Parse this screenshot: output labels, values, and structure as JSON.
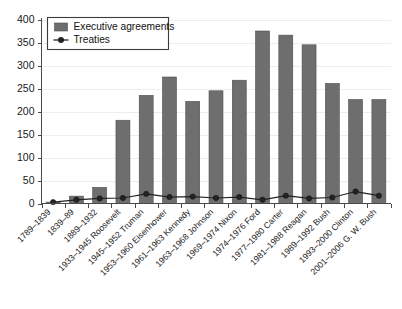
{
  "chart_data": {
    "type": "bar",
    "title": "",
    "subtitle": "",
    "xlabel": "",
    "ylabel": "",
    "ylim": [
      0,
      400
    ],
    "yticks": [
      0,
      50,
      100,
      150,
      200,
      250,
      300,
      350,
      400
    ],
    "ytick_labels": [
      "0",
      "50",
      "100",
      "150",
      "200",
      "250",
      "300",
      "350",
      "400"
    ],
    "grid": true,
    "grid_axis": "y",
    "legend_position": "upper-left",
    "categories": [
      "1789–1839",
      "1839–89",
      "1889–1932",
      "1933–1945 Roosevelt",
      "1945–1952 Truman",
      "1953–1960 Eisenhower",
      "1961–1963 Kennedy",
      "1963–1968 Johnson",
      "1969–1974 Nixon",
      "1974–1976 Ford",
      "1977–1980 Carter",
      "1981–1988 Reagan",
      "1989–1992 Bush",
      "1993–2000 Clinton",
      "2001–2006 G. W. Bush"
    ],
    "series": [
      {
        "name": "Executive agreements",
        "type": "bar",
        "color": "#6e6e6e",
        "values": [
          3,
          16,
          35,
          181,
          235,
          275,
          222,
          245,
          268,
          375,
          366,
          345,
          261,
          226,
          226
        ]
      },
      {
        "name": "Treaties",
        "type": "line",
        "color": "#232323",
        "marker": "circle",
        "values": [
          3,
          8,
          11,
          12,
          21,
          14,
          15,
          12,
          14,
          8,
          17,
          11,
          13,
          26,
          17
        ]
      }
    ],
    "legend": [
      {
        "label": "Executive agreements",
        "marker": "square",
        "color": "#6e6e6e"
      },
      {
        "label": "Treaties",
        "marker": "line-circle",
        "color": "#232323"
      }
    ]
  },
  "colors": {
    "bar": "#6e6e6e",
    "bar_edge": "#4f4f4f",
    "line": "#232323",
    "axis": "#4a4a4a",
    "grid": "#e8e8e8",
    "text": "#1a1a1a",
    "background": "#ffffff"
  }
}
